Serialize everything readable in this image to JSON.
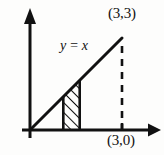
{
  "figure": {
    "background_color": "#fdfdfc",
    "ink_color": "#111111",
    "labels": {
      "equation": "y = x",
      "point_top": "(3,3)",
      "point_bottom": "(3,0)"
    },
    "axes": {
      "x_axis_name": "x-axis",
      "y_axis_name": "y-axis",
      "origin_x": 30,
      "origin_y": 130,
      "x_axis_end_x": 158,
      "y_axis_end_y": 12,
      "stroke_width": 3,
      "arrowheads": true
    },
    "line": {
      "name": "y-equals-x-line",
      "equation": "y = x",
      "from": [
        0,
        0
      ],
      "to": [
        3,
        3
      ],
      "pixel_from": [
        30,
        130
      ],
      "pixel_to": [
        122,
        38
      ],
      "stroke_width": 3
    },
    "dashed_segment": {
      "name": "dashed-vertical-at-x-3",
      "from": [
        3,
        3
      ],
      "to": [
        3,
        0
      ],
      "pixel_x": 122,
      "pixel_top_y": 46,
      "pixel_bottom_y": 129,
      "dash_pattern": "7 6",
      "stroke_width": 2.6
    },
    "shaded_strip": {
      "name": "hatched-region",
      "fill_style": "diagonal-hatch",
      "hatch_angle_degrees": 45,
      "hatch_count": 7,
      "pixel_left_x": 63,
      "pixel_right_x": 80,
      "pixel_baseline_y": 129,
      "pixel_left_top_y": 97,
      "pixel_right_top_y": 80,
      "edge_stroke_width": 2.6
    },
    "tick": {
      "name": "x-axis-tick-at-3",
      "pixel_x": 122,
      "pixel_y_top": 124,
      "pixel_y_bottom": 130
    }
  }
}
